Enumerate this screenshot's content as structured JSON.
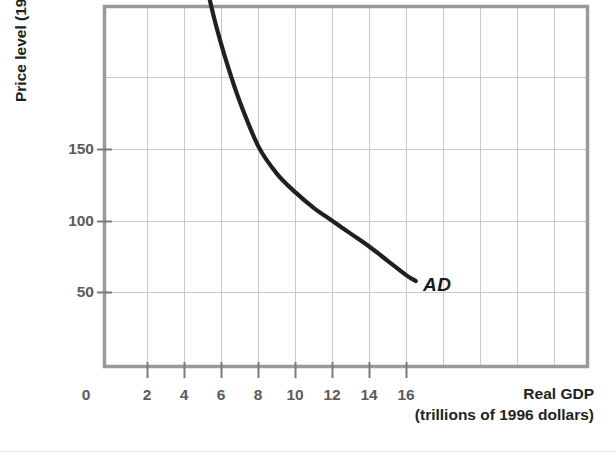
{
  "figure": {
    "background_color": "#ffffff",
    "frame_color": "#9a9a9a",
    "grid_color": "#c9c9cb",
    "curve_color": "#231f20",
    "tick_label_color": "#5b5b5f",
    "title_color": "#231f20"
  },
  "chart_data": {
    "type": "line",
    "title": "",
    "subtitle": "",
    "xlabel": "Real GDP",
    "xlabel_line2": "(trillions of 1996 dollars)",
    "ylabel": "Price level (1996 = 100)",
    "xlim": [
      0,
      22
    ],
    "ylim": [
      0,
      278
    ],
    "xticks": [
      0,
      2,
      4,
      6,
      8,
      10,
      12,
      14,
      16
    ],
    "xtick_labels": [
      "0",
      "2",
      "4",
      "6",
      "8",
      "10",
      "12",
      "14",
      "16"
    ],
    "yticks": [
      50,
      100,
      150
    ],
    "ytick_labels": [
      "50",
      "100",
      "150"
    ],
    "grid": true,
    "grid_x_values": [
      2,
      4,
      6,
      8,
      10,
      12,
      14,
      16,
      18,
      20
    ],
    "grid_y_values": [
      50,
      100,
      150,
      200
    ],
    "legend": "none",
    "series": [
      {
        "name": "AD",
        "annotation": "AD",
        "annotation_x": 16.9,
        "annotation_y": 48,
        "x": [
          5.0,
          5.6,
          6.3,
          7.0,
          8.0,
          9.0,
          10.0,
          11.0,
          12.0,
          13.0,
          14.0,
          15.0,
          16.0,
          16.5
        ],
        "y": [
          276,
          242,
          210,
          183,
          152,
          133,
          120,
          109,
          100,
          91,
          82,
          72,
          62,
          58
        ]
      }
    ],
    "annotations": [
      {
        "text": "AD",
        "x": 16.9,
        "y": 48,
        "style": "bold-italic"
      }
    ]
  }
}
